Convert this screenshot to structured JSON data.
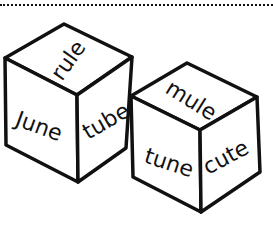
{
  "illustration": {
    "description": "Two word dice with long-u words",
    "stroke_color": "#111111",
    "background": "#ffffff",
    "dice": [
      {
        "name": "die-1",
        "faces": {
          "top": "rule",
          "left": "June",
          "right": "tube"
        }
      },
      {
        "name": "die-2",
        "faces": {
          "top": "mule",
          "left": "tune",
          "right": "cute"
        }
      }
    ]
  }
}
